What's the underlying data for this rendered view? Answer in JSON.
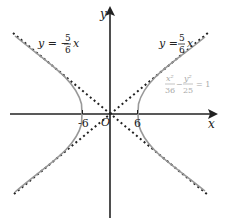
{
  "diagram": {
    "type": "hyperbola",
    "equation": {
      "x_num": "x²",
      "x_den": "36",
      "minus": "−",
      "y_num": "y²",
      "y_den": "25",
      "rhs": "= 1"
    },
    "axes": {
      "x_label": "x",
      "y_label": "y",
      "origin_label": "O"
    },
    "ticks": {
      "neg_vertex": "-6",
      "pos_vertex": "6"
    },
    "asymptote_pos": {
      "lhs": "y =",
      "num": "5",
      "den": "6",
      "var": "x"
    },
    "asymptote_neg": {
      "lhs": "y = −",
      "num": "5",
      "den": "6",
      "var": "x"
    },
    "colors": {
      "axis": "#222222",
      "curve": "#999999",
      "asymptote": "#222222",
      "equation_text": "#aaaaaa",
      "label_text": "#222222"
    }
  }
}
